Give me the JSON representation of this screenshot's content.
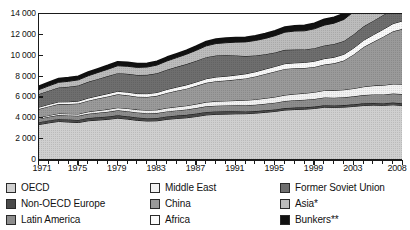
{
  "chart_data": {
    "type": "area",
    "title": "",
    "subtitle": "",
    "xlabel": "",
    "ylabel": "",
    "stacked": true,
    "grid": false,
    "legend_position": "bottom",
    "ylim": [
      0,
      14000
    ],
    "yticks": [
      "0",
      "2 000",
      "4 000",
      "6 000",
      "8 000",
      "10 000",
      "12 000",
      "14 000"
    ],
    "ytick_values": [
      0,
      2000,
      4000,
      6000,
      8000,
      10000,
      12000,
      14000
    ],
    "xlim": [
      1971,
      2008
    ],
    "xticks": [
      "1971",
      "1975",
      "1979",
      "1983",
      "1987",
      "1991",
      "1995",
      "1999",
      "2003",
      "2008"
    ],
    "xtick_values": [
      1971,
      1975,
      1979,
      1983,
      1987,
      1991,
      1995,
      1999,
      2003,
      2008
    ],
    "x": [
      1971,
      1972,
      1973,
      1974,
      1975,
      1976,
      1977,
      1978,
      1979,
      1980,
      1981,
      1982,
      1983,
      1984,
      1985,
      1986,
      1987,
      1988,
      1989,
      1990,
      1991,
      1992,
      1993,
      1994,
      1995,
      1996,
      1997,
      1998,
      1999,
      2000,
      2001,
      2002,
      2003,
      2004,
      2005,
      2006,
      2007,
      2008
    ],
    "series": [
      {
        "name": "OECD",
        "color": "#cfcfcf",
        "values": [
          3400,
          3560,
          3700,
          3640,
          3590,
          3760,
          3830,
          3900,
          4010,
          3920,
          3800,
          3740,
          3760,
          3900,
          3980,
          4050,
          4170,
          4320,
          4380,
          4400,
          4430,
          4440,
          4490,
          4570,
          4660,
          4790,
          4840,
          4870,
          4940,
          5060,
          5040,
          5070,
          5140,
          5230,
          5260,
          5240,
          5290,
          5220
        ]
      },
      {
        "name": "Non-OECD Europe",
        "color": "#4a4a4a",
        "values": [
          230,
          236,
          242,
          248,
          254,
          260,
          266,
          272,
          278,
          276,
          272,
          268,
          270,
          276,
          280,
          284,
          288,
          288,
          282,
          268,
          240,
          216,
          200,
          190,
          188,
          190,
          188,
          186,
          186,
          190,
          194,
          196,
          202,
          206,
          208,
          212,
          214,
          212
        ]
      },
      {
        "name": "Latin America",
        "color": "#8d8d8d",
        "values": [
          330,
          348,
          368,
          384,
          392,
          412,
          432,
          452,
          472,
          480,
          482,
          478,
          472,
          482,
          492,
          508,
          524,
          540,
          552,
          562,
          578,
          596,
          610,
          632,
          650,
          676,
          702,
          720,
          726,
          746,
          744,
          748,
          762,
          792,
          820,
          840,
          866,
          886
        ]
      },
      {
        "name": "Middle East",
        "color": "#f2f2f2",
        "values": [
          120,
          134,
          150,
          162,
          176,
          196,
          216,
          236,
          258,
          268,
          278,
          292,
          310,
          330,
          348,
          368,
          386,
          404,
          420,
          438,
          456,
          482,
          506,
          528,
          548,
          572,
          596,
          626,
          650,
          676,
          700,
          724,
          756,
          800,
          844,
          880,
          920,
          960
        ]
      },
      {
        "name": "China",
        "color": "#9a9a9a",
        "values": [
          800,
          860,
          900,
          930,
          1000,
          1060,
          1150,
          1230,
          1280,
          1260,
          1230,
          1270,
          1340,
          1440,
          1540,
          1630,
          1740,
          1850,
          1920,
          1950,
          2010,
          2090,
          2200,
          2330,
          2440,
          2510,
          2470,
          2420,
          2420,
          2480,
          2590,
          2800,
          3260,
          3800,
          4200,
          4650,
          5050,
          5300
        ]
      },
      {
        "name": "Africa",
        "color": "#fafafa",
        "values": [
          190,
          200,
          212,
          222,
          234,
          248,
          262,
          276,
          292,
          300,
          308,
          316,
          326,
          338,
          352,
          366,
          380,
          392,
          404,
          416,
          428,
          442,
          456,
          470,
          486,
          502,
          520,
          536,
          552,
          570,
          586,
          604,
          626,
          656,
          686,
          712,
          744,
          776
        ]
      },
      {
        "name": "Former Soviet Union",
        "color": "#6e6e6e",
        "values": [
          1250,
          1310,
          1380,
          1440,
          1500,
          1560,
          1620,
          1680,
          1740,
          1760,
          1780,
          1800,
          1840,
          1890,
          1940,
          1990,
          2030,
          2070,
          2060,
          2000,
          1880,
          1700,
          1560,
          1420,
          1340,
          1320,
          1270,
          1240,
          1250,
          1260,
          1270,
          1270,
          1310,
          1330,
          1340,
          1370,
          1380,
          1400
        ]
      },
      {
        "name": "Asia*",
        "color": "#bcbcbc",
        "values": [
          430,
          460,
          500,
          520,
          540,
          580,
          620,
          660,
          710,
          720,
          730,
          750,
          790,
          840,
          890,
          950,
          1010,
          1080,
          1150,
          1210,
          1280,
          1360,
          1440,
          1520,
          1610,
          1700,
          1780,
          1790,
          1860,
          1950,
          2000,
          2070,
          2170,
          2290,
          2380,
          2480,
          2580,
          2660
        ]
      },
      {
        "name": "Bunkers**",
        "color": "#121212",
        "values": [
          320,
          330,
          345,
          340,
          336,
          346,
          356,
          366,
          378,
          372,
          362,
          356,
          352,
          360,
          368,
          380,
          394,
          408,
          420,
          430,
          436,
          442,
          448,
          458,
          470,
          484,
          500,
          512,
          524,
          544,
          548,
          556,
          578,
          612,
          640,
          668,
          700,
          720
        ]
      }
    ]
  },
  "legend": {
    "columns": [
      [
        {
          "label": "OECD",
          "color": "#cfcfcf",
          "icon": "legend-swatch-icon"
        },
        {
          "label": "Non-OECD Europe",
          "color": "#4a4a4a",
          "icon": "legend-swatch-icon"
        },
        {
          "label": "Latin America",
          "color": "#8d8d8d",
          "icon": "legend-swatch-icon"
        }
      ],
      [
        {
          "label": "Middle East",
          "color": "#f2f2f2",
          "icon": "legend-swatch-icon"
        },
        {
          "label": "China",
          "color": "#9a9a9a",
          "icon": "legend-swatch-icon"
        },
        {
          "label": "Africa",
          "color": "#fafafa",
          "icon": "legend-swatch-icon"
        }
      ],
      [
        {
          "label": "Former Soviet Union",
          "color": "#6e6e6e",
          "icon": "legend-swatch-icon"
        },
        {
          "label": "Asia*",
          "color": "#bcbcbc",
          "icon": "legend-swatch-icon"
        },
        {
          "label": "Bunkers**",
          "color": "#121212",
          "icon": "legend-swatch-icon"
        }
      ]
    ]
  }
}
